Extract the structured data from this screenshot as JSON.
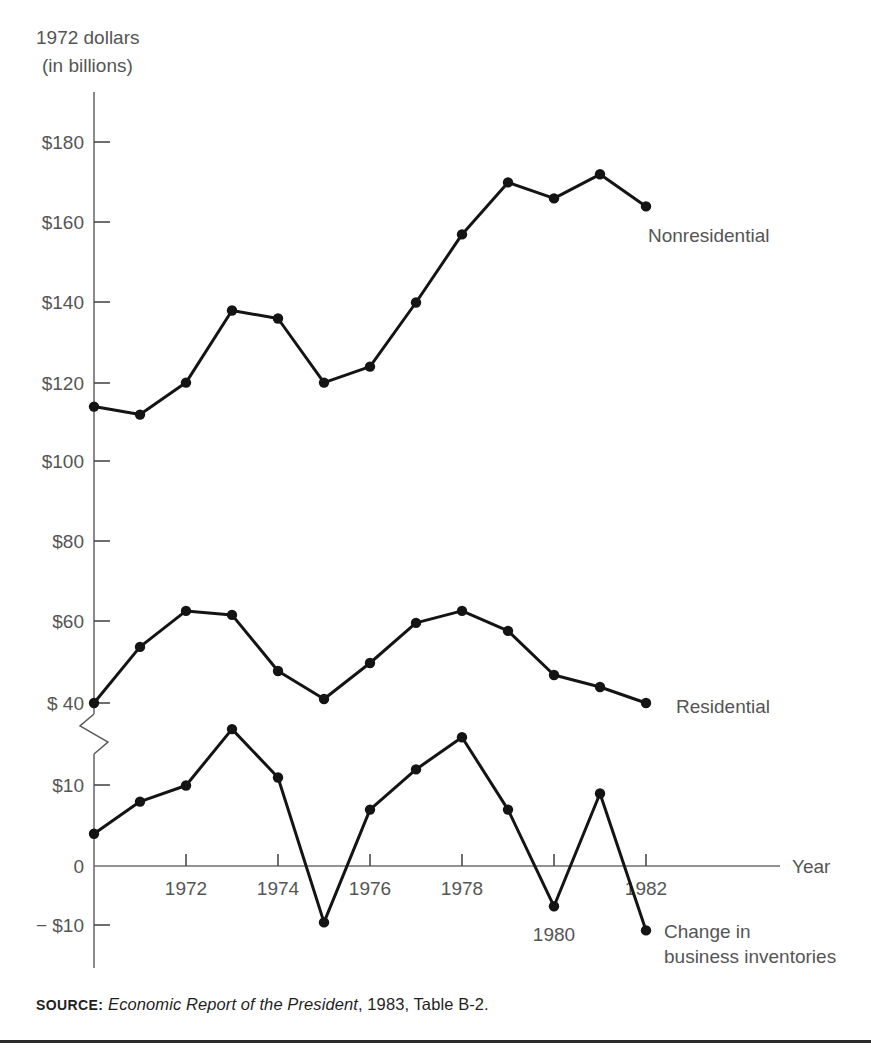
{
  "figure": {
    "unit_label_line1": "1972 dollars",
    "unit_label_line2": "(in billions)",
    "x_axis_title": "Year",
    "source_kicker": "SOURCE:",
    "source_title": "Economic Report of the President",
    "source_rest": ", 1983, Table B-2."
  },
  "labels": {
    "nonresidential": "Nonresidential",
    "residential": "Residential",
    "inventories_line1": "Change in",
    "inventories_line2": "business inventories"
  },
  "colors": {
    "line": "#141414",
    "axis": "#6e6e6e",
    "text": "#555555",
    "background": "#ffffff"
  },
  "chart_data": {
    "type": "line",
    "title": "",
    "subtitle": "",
    "xlabel": "Year",
    "ylabel": "1972 dollars (in billions)",
    "grid": false,
    "legend_position": "inline-right-of-series",
    "broken_axis": {
      "present": true,
      "between": [
        20,
        40
      ],
      "note": "Y axis is broken between $20 and $40; upper segment $40-$180 in $20 steps, lower segment -$10 to $10 in $10 steps"
    },
    "x": [
      1970,
      1971,
      1972,
      1973,
      1974,
      1975,
      1976,
      1977,
      1978,
      1979,
      1980,
      1981,
      1982
    ],
    "xlim": [
      1970,
      1983
    ],
    "x_ticks": [
      1972,
      1974,
      1976,
      1978,
      1980,
      1982
    ],
    "x_tick_labels": [
      "1972",
      "1974",
      "1976",
      "1978",
      "1980",
      "1982"
    ],
    "y_ticks_upper": [
      40,
      60,
      80,
      100,
      120,
      140,
      160,
      180
    ],
    "y_tick_labels_upper": [
      "$ 40",
      "$60",
      "$80",
      "$100",
      "$120",
      "$140",
      "$160",
      "$180"
    ],
    "y_ticks_lower": [
      -10,
      0,
      10
    ],
    "y_tick_labels_lower": [
      "− $10",
      "0",
      "$10"
    ],
    "series": [
      {
        "name": "Nonresidential",
        "values": [
          114,
          112,
          120,
          138,
          136,
          120,
          124,
          140,
          157,
          170,
          166,
          172,
          164
        ]
      },
      {
        "name": "Residential",
        "values": [
          40,
          54,
          63,
          62,
          48,
          41,
          50,
          60,
          63,
          58,
          47,
          44,
          40
        ]
      },
      {
        "name": "Change in business inventories",
        "values": [
          4,
          8,
          10,
          17,
          11,
          -7,
          7,
          12,
          16,
          7,
          -5,
          9,
          -8
        ]
      }
    ]
  }
}
